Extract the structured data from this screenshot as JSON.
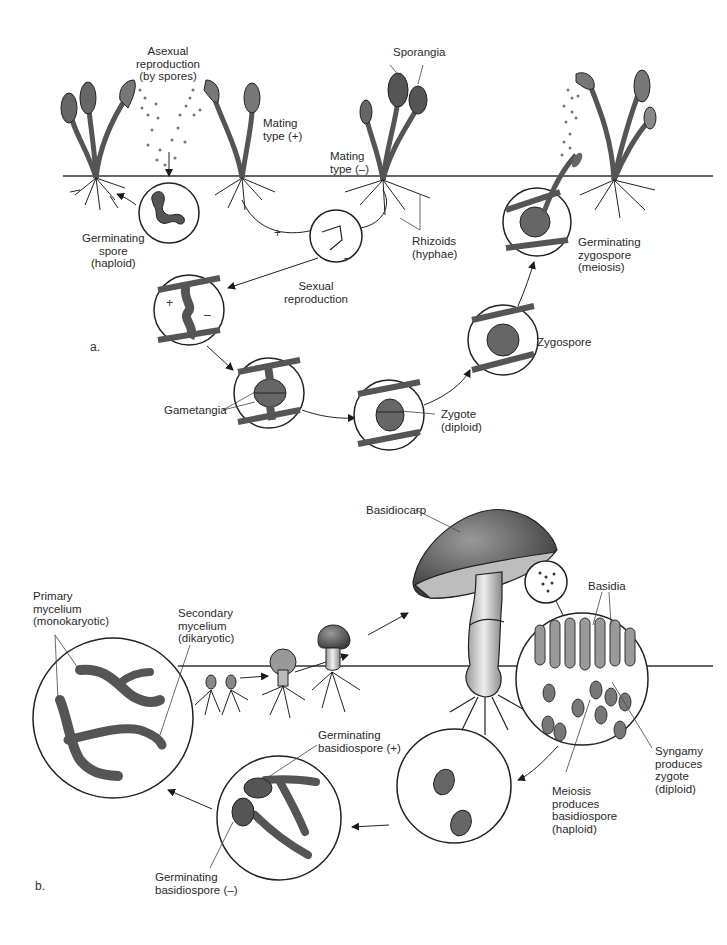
{
  "figure": {
    "panels": [
      {
        "id": "a",
        "label": "a.",
        "title": "Zygomycete (bread mold) life cycle"
      },
      {
        "id": "b",
        "label": "b.",
        "title": "Basidiomycete (mushroom) life cycle"
      }
    ]
  },
  "panel_a": {
    "labels": {
      "asexual": "Asexual\nreproduction\n(by spores)",
      "sporangia": "Sporangia",
      "mating_plus": "Mating\ntype (+)",
      "mating_minus": "Mating\ntype (–)",
      "germinating_spore": "Germinating\nspore\n(haploid)",
      "sexual": "Sexual\nreproduction",
      "rhizoids": "Rhizoids\n(hyphae)",
      "germinating_zygospore": "Germinating\nzygospore\n(meiosis)",
      "zygospore": "Zygospore",
      "gametangia": "Gametangia",
      "zygote": "Zygote\n(diploid)"
    },
    "signs": {
      "plus": "+",
      "minus": "–"
    }
  },
  "panel_b": {
    "labels": {
      "basidiocarp": "Basidiocarp",
      "basidia": "Basidia",
      "primary_mycelium": "Primary\nmycelium\n(monokaryotic)",
      "secondary_mycelium": "Secondary\nmycelium\n(dikaryotic)",
      "germ_basidiospore_plus": "Germinating\nbasidiospore (+)",
      "germ_basidiospore_minus": "Germinating\nbasidiospore (–)",
      "meiosis": "Meiosis\nproduces\nbasidiospore\n(haploid)",
      "syngamy": "Syngamy\nproduces\nzygote\n(diploid)"
    }
  },
  "colors": {
    "ink": "#1a1a1a",
    "fill_dark": "#555555",
    "fill_mid": "#8a8a8a",
    "fill_light": "#c8c8c8"
  }
}
